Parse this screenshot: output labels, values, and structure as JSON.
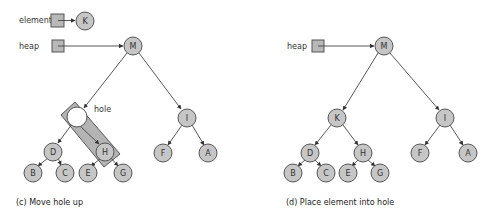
{
  "colors": {
    "node_fill": "#c6c6c6",
    "node_stroke": "#555555",
    "hole_box_fill": "#b4b4b4",
    "background": "#ffffff"
  },
  "panel_c": {
    "caption": "(c) Move hole up",
    "labels": {
      "element": "element",
      "heap": "heap",
      "hole": "hole"
    },
    "element_node": "K",
    "root": "M",
    "hole_node": "",
    "nodes": {
      "D": "D",
      "H": "H",
      "B": "B",
      "C": "C",
      "E": "E",
      "G": "G",
      "I": "I",
      "F": "F",
      "A": "A"
    }
  },
  "panel_d": {
    "caption": "(d) Place element into hole",
    "labels": {
      "heap": "heap"
    },
    "root": "M",
    "nodes": {
      "K": "K",
      "D": "D",
      "H": "H",
      "B": "B",
      "C": "C",
      "E": "E",
      "G": "G",
      "I": "I",
      "F": "F",
      "A": "A"
    }
  }
}
